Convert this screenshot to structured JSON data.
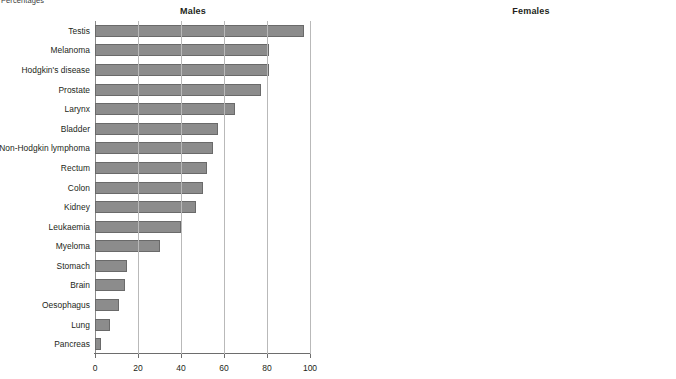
{
  "figure": {
    "note": "Percentages"
  },
  "chart_data": {
    "type": "bar",
    "title": "Percentages",
    "orientation": "horizontal",
    "xlabel": "",
    "ylabel": "",
    "xlim": [
      0,
      100
    ],
    "xticks": [
      0,
      20,
      40,
      60,
      80,
      100
    ],
    "grid": true,
    "legend": "none",
    "bar_color": "#8c8c8c",
    "panels": [
      {
        "title": "Males",
        "categories": [
          "Testis",
          "Melanoma",
          "Hodgkin's disease",
          "Prostate",
          "Larynx",
          "Bladder",
          "Non-Hodgkin lymphoma",
          "Rectum",
          "Colon",
          "Kidney",
          "Leukaemia",
          "Myeloma",
          "Stomach",
          "Brain",
          "Oesophagus",
          "Lung",
          "Pancreas"
        ],
        "values": [
          97,
          81,
          81,
          77,
          65,
          57,
          55,
          52,
          50,
          47,
          40,
          30,
          15,
          14,
          11,
          7,
          3
        ]
      },
      {
        "title": "Females",
        "categories": [
          "Melanoma",
          "Breast",
          "Hodgkin's disease",
          "Uterus",
          "Cervix",
          "Non-Hodgkin lymphoma",
          "Rectum",
          "Colon",
          "Kidney",
          "Bladder",
          "Leukaemia",
          "Ovary",
          "Myeloma",
          "Stomach",
          "Brain<sup>2</sup>",
          "Oesophagus",
          "Lung",
          "Pancreas"
        ],
        "values": [
          90,
          83,
          83,
          75,
          64,
          60,
          55,
          52,
          50,
          47,
          41,
          39,
          30,
          16,
          13,
          12,
          9,
          3
        ]
      }
    ]
  }
}
